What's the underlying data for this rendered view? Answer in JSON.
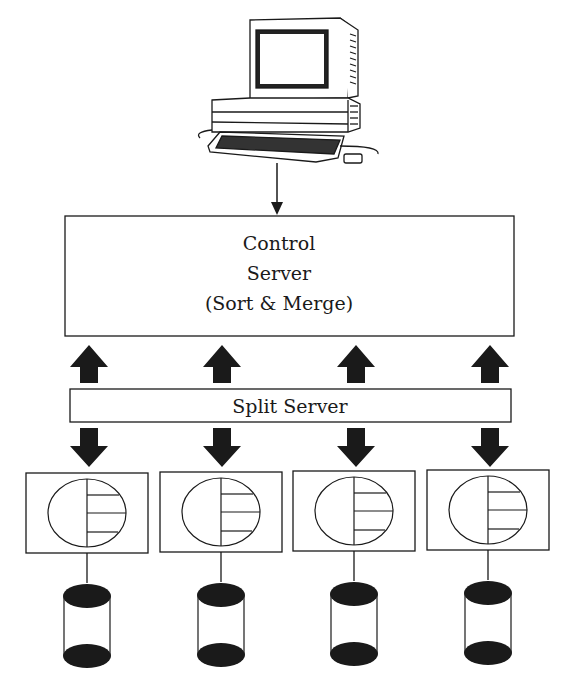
{
  "diagram": {
    "terminal": {
      "label": "Workstation",
      "icon": "computer-terminal-icon"
    },
    "control_server": {
      "lines": [
        "Control",
        "Server",
        "(Sort & Merge)"
      ]
    },
    "split_server": {
      "label": "Split Server"
    },
    "nodes": [
      {
        "id": "node-1",
        "processor_icon": "processor-icon",
        "storage_icon": "disk-cylinder-icon"
      },
      {
        "id": "node-2",
        "processor_icon": "processor-icon",
        "storage_icon": "disk-cylinder-icon"
      },
      {
        "id": "node-3",
        "processor_icon": "processor-icon",
        "storage_icon": "disk-cylinder-icon"
      },
      {
        "id": "node-4",
        "processor_icon": "processor-icon",
        "storage_icon": "disk-cylinder-icon"
      }
    ],
    "flows": {
      "terminal_to_control": "down",
      "split_to_control": "up",
      "split_to_nodes": "down"
    },
    "colors": {
      "ink": "#1a1a1a",
      "paper": "#ffffff"
    }
  }
}
